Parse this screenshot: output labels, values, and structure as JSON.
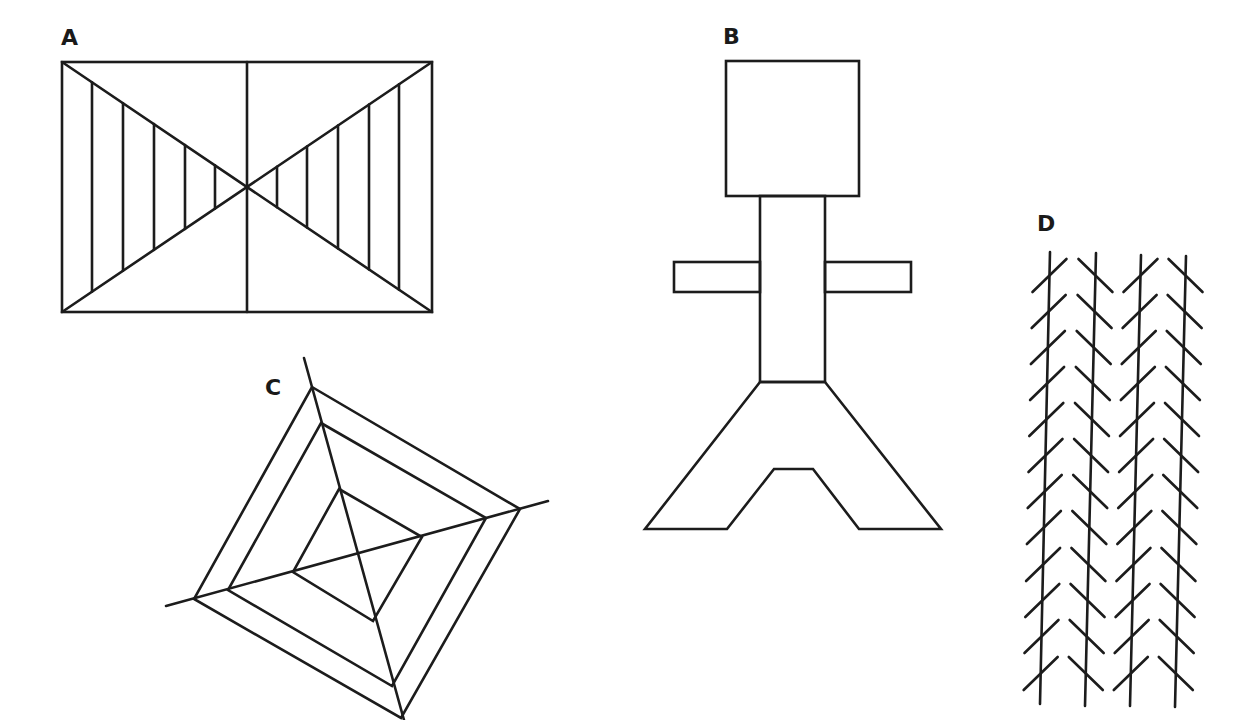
{
  "figures": {
    "A": {
      "label": "A",
      "label_pos": [
        61,
        27
      ],
      "rect": [
        62,
        62,
        432,
        312
      ],
      "center": [
        247,
        187
      ],
      "left_verticals_x": [
        92,
        123,
        154,
        185,
        215
      ],
      "right_verticals_x": [
        277,
        307,
        338,
        369,
        399
      ]
    },
    "B": {
      "label": "B",
      "label_pos": [
        723,
        26
      ],
      "head": [
        726,
        61,
        859,
        196
      ],
      "body": [
        760,
        196,
        825,
        382
      ],
      "left_arm": [
        674,
        262,
        760,
        292
      ],
      "right_arm": [
        825,
        262,
        911,
        292
      ],
      "legs": [
        [
          760,
          382
        ],
        [
          645,
          529
        ],
        [
          727,
          529
        ],
        [
          774,
          469
        ],
        [
          813,
          469
        ],
        [
          859,
          529
        ],
        [
          941,
          529
        ],
        [
          825,
          382
        ]
      ]
    },
    "C": {
      "label": "C",
      "label_pos": [
        265,
        377
      ],
      "axis_top": [
        304,
        358
      ],
      "axis_right": [
        548,
        501
      ],
      "axis_left": [
        166,
        606
      ],
      "axis_bottom": [
        404,
        720
      ],
      "outer": [
        [
          312,
          387
        ],
        [
          520,
          509
        ],
        [
          401,
          718
        ],
        [
          194,
          599
        ]
      ],
      "middle": [
        [
          321,
          423
        ],
        [
          486,
          518
        ],
        [
          392,
          686
        ],
        [
          228,
          590
        ]
      ],
      "inner": [
        [
          339,
          489
        ],
        [
          422,
          537
        ],
        [
          373,
          621
        ],
        [
          293,
          572
        ]
      ]
    },
    "D": {
      "label": "D",
      "label_pos": [
        1037,
        213
      ],
      "lines": [
        {
          "top": [
            1050,
            252
          ],
          "bottom": [
            1040,
            704
          ],
          "hatch": "forward"
        },
        {
          "top": [
            1096,
            253
          ],
          "bottom": [
            1085,
            706
          ],
          "hatch": "back"
        },
        {
          "top": [
            1141,
            255
          ],
          "bottom": [
            1130,
            706
          ],
          "hatch": "forward"
        },
        {
          "top": [
            1186,
            256
          ],
          "bottom": [
            1175,
            707
          ],
          "hatch": "back"
        }
      ],
      "hatch_tops_y": [
        259,
        295,
        331,
        367,
        403,
        439,
        475,
        511,
        548,
        584,
        620,
        657
      ],
      "hatch_half_width": 17,
      "hatch_height": 33
    }
  },
  "colors": {
    "ink": "#1c1c1c",
    "background": "#ffffff"
  }
}
